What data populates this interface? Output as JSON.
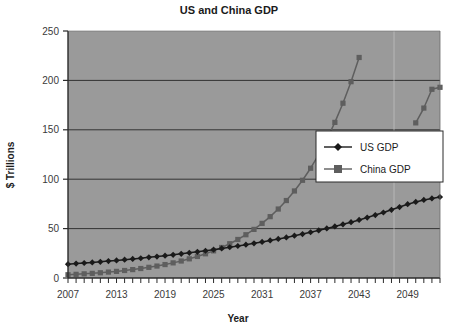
{
  "chart_data": {
    "type": "line",
    "title": "US and China GDP",
    "xlabel": "Year",
    "ylabel": "$ Trillions",
    "xlim": [
      2007,
      2053
    ],
    "ylim": [
      0,
      250
    ],
    "yticks": [
      0,
      50,
      100,
      150,
      200,
      250
    ],
    "xticks": [
      2007,
      2013,
      2019,
      2025,
      2031,
      2037,
      2043,
      2049
    ],
    "xtick_step_minor": 1,
    "grid": "horizontal",
    "legend_position": "center-right",
    "plot_background": "#9a9a9a",
    "x": [
      2007,
      2008,
      2009,
      2010,
      2011,
      2012,
      2013,
      2014,
      2015,
      2016,
      2017,
      2018,
      2019,
      2020,
      2021,
      2022,
      2023,
      2024,
      2025,
      2026,
      2027,
      2028,
      2029,
      2030,
      2031,
      2032,
      2033,
      2034,
      2035,
      2036,
      2037,
      2038,
      2039,
      2040,
      2041,
      2042,
      2043,
      2044,
      2045,
      2046,
      2047,
      2048,
      2049,
      2050,
      2051,
      2052,
      2053
    ],
    "series": [
      {
        "name": "US GDP",
        "color": "#1a1a1a",
        "marker": "diamond",
        "values": [
          14.0,
          14.6,
          15.2,
          15.8,
          16.4,
          17.1,
          17.8,
          18.5,
          19.3,
          20.0,
          20.9,
          21.7,
          22.6,
          23.5,
          24.5,
          25.5,
          26.5,
          27.6,
          28.7,
          29.9,
          31.1,
          32.4,
          33.7,
          35.1,
          36.5,
          38.0,
          39.5,
          41.1,
          42.8,
          44.5,
          46.3,
          48.2,
          50.2,
          52.2,
          54.3,
          56.5,
          58.8,
          61.2,
          63.7,
          66.3,
          69.0,
          71.8,
          74.7,
          77.0,
          79.0,
          80.5,
          82.0
        ]
      },
      {
        "name": "China GDP",
        "color": "#5e5e5e",
        "marker": "square",
        "values": [
          3.3,
          3.7,
          4.2,
          4.7,
          5.3,
          6.0,
          6.7,
          7.6,
          8.5,
          9.6,
          10.8,
          12.1,
          13.6,
          15.3,
          17.2,
          19.4,
          21.8,
          24.5,
          27.5,
          30.9,
          34.7,
          39.0,
          43.8,
          49.2,
          55.3,
          62.1,
          69.8,
          78.4,
          88.1,
          98.9,
          111.1,
          124.8,
          140.2,
          157.5,
          176.9,
          198.7,
          223.2,
          250.7,
          281.6,
          316.3,
          355.3,
          399.1,
          448.2,
          157.0,
          172.0,
          191.0,
          193.0
        ]
      }
    ],
    "series_clip_note": "China GDP drawn series visible up to ~96 near 2045 then resumes near 157-193 at 2050-2053"
  },
  "axis": {
    "y_ticks": [
      "250",
      "200",
      "150",
      "100",
      "50",
      "0"
    ],
    "x_ticks": [
      "2007",
      "2013",
      "2019",
      "2025",
      "2031",
      "2037",
      "2043",
      "2049"
    ]
  },
  "legend": {
    "items": [
      {
        "label": "US GDP",
        "marker": "diamond",
        "color": "#1a1a1a"
      },
      {
        "label": "China GDP",
        "marker": "square",
        "color": "#5e5e5e"
      }
    ]
  },
  "colors": {
    "plot_bg": "#9a9a9a",
    "page_bg": "#ffffff",
    "axis": "#2b2b2b",
    "us": "#1a1a1a",
    "china": "#5e5e5e",
    "legend_bg": "#ffffff"
  }
}
